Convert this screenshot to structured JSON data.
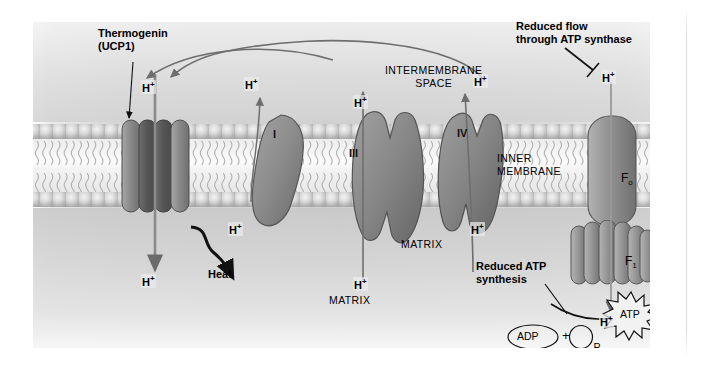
{
  "figure": {
    "compartments": {
      "intermembrane_space": "INTERMEMBRANE\nSPACE",
      "inner_membrane": "INNER\nMEMBRANE",
      "matrix_center": "MATRIX",
      "matrix_left": "MATRIX"
    },
    "annotations": {
      "thermogenin": "Thermogenin\n(UCP1)",
      "heat": "Heat",
      "reduced_flow": "Reduced flow\nthrough ATP synthase",
      "reduced_atp": "Reduced ATP\nsynthesis"
    },
    "complexes": [
      {
        "id": "thermogenin",
        "label": "",
        "kind": "channel"
      },
      {
        "id": "complex-i",
        "label": "I",
        "kind": "blob"
      },
      {
        "id": "complex-iii",
        "label": "III",
        "kind": "blob"
      },
      {
        "id": "complex-iv",
        "label": "IV",
        "kind": "blob"
      },
      {
        "id": "atp-synthase-fo",
        "label": "F",
        "sub": "o",
        "kind": "channel"
      },
      {
        "id": "atp-synthase-f1",
        "label": "F",
        "sub": "1",
        "kind": "lobed"
      }
    ],
    "atp_synthase": {
      "fo_label": "F",
      "fo_sub": "o",
      "f1_label": "F",
      "f1_sub": "1"
    },
    "reaction": {
      "substrate": "ADP",
      "plus": "+",
      "phosphate": "P",
      "phosphate_sub": "i",
      "product": "ATP"
    },
    "proton_labels": [
      {
        "id": "h-thermogenin-top",
        "text": "H",
        "sup": "+"
      },
      {
        "id": "h-thermogenin-bot",
        "text": "H",
        "sup": "+"
      },
      {
        "id": "h-complex-i-top",
        "text": "H",
        "sup": "+"
      },
      {
        "id": "h-complex-i-bot",
        "text": "H",
        "sup": "+"
      },
      {
        "id": "h-complex-iii-top",
        "text": "H",
        "sup": "+"
      },
      {
        "id": "h-complex-iii-bot",
        "text": "H",
        "sup": "+"
      },
      {
        "id": "h-complex-iv-top",
        "text": "H",
        "sup": "+"
      },
      {
        "id": "h-complex-iv-bot",
        "text": "H",
        "sup": "+"
      },
      {
        "id": "h-atp-synthase-top",
        "text": "H",
        "sup": "+"
      },
      {
        "id": "h-atp-synthase-bot",
        "text": "H",
        "sup": "+"
      }
    ],
    "colors": {
      "protein_fill": "#8f8f8f",
      "protein_stroke": "#5d5d5d",
      "arrow": "#6e6e6e",
      "text": "#000000",
      "membrane_light": "#f7f7f7",
      "background": "#d4d4d4"
    }
  }
}
